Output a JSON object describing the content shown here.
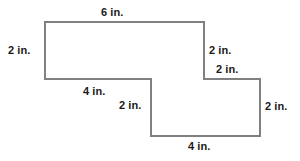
{
  "figure": {
    "type": "composite-polygon",
    "units": "in.",
    "stroke_color": "#808080",
    "fill_color": "#ffffff",
    "background_color": "#ffffff",
    "text_color": "#1a1a1a",
    "vertices": [
      {
        "name": "top-left",
        "x": 45,
        "y": 22
      },
      {
        "name": "top-right",
        "x": 204,
        "y": 22
      },
      {
        "name": "upper-step-right",
        "x": 204,
        "y": 79
      },
      {
        "name": "lower-right-top",
        "x": 260,
        "y": 79
      },
      {
        "name": "bottom-right",
        "x": 260,
        "y": 136
      },
      {
        "name": "bottom-left",
        "x": 151,
        "y": 136
      },
      {
        "name": "inner-step-corner",
        "x": 151,
        "y": 79
      },
      {
        "name": "upper-left-bottom",
        "x": 45,
        "y": 79
      }
    ],
    "labels": {
      "top": "6 in.",
      "left": "2 in.",
      "right_upper": "2 in.",
      "right_step": "2 in.",
      "mid_bottom": "4 in.",
      "mid_vertical": "2 in.",
      "right_lower": "2 in.",
      "bottom": "4 in."
    }
  }
}
